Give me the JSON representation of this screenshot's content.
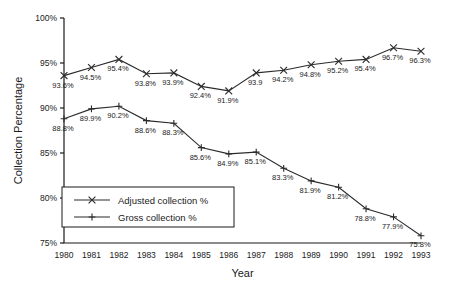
{
  "chart_data": {
    "type": "line",
    "title": "",
    "xlabel": "Year",
    "ylabel": "Collection Percentage",
    "grid": false,
    "legend_position": "inside-lower-left",
    "x": [
      1980,
      1981,
      1982,
      1983,
      1984,
      1985,
      1986,
      1987,
      1988,
      1989,
      1990,
      1991,
      1992,
      1993
    ],
    "categories": [
      "1980",
      "1981",
      "1982",
      "1983",
      "1984",
      "1985",
      "1986",
      "1987",
      "1988",
      "1989",
      "1990",
      "1991",
      "1992",
      "1993"
    ],
    "ylim": [
      75,
      100
    ],
    "yticks": [
      75,
      80,
      85,
      90,
      95,
      100
    ],
    "ytick_labels": [
      "75%",
      "80%",
      "85%",
      "90%",
      "95%",
      "100%"
    ],
    "series": [
      {
        "name": "Gross collection %",
        "marker": "x",
        "values": [
          93.6,
          94.5,
          95.4,
          93.8,
          93.9,
          92.4,
          91.9,
          93.9,
          94.2,
          94.8,
          95.2,
          95.4,
          96.7,
          96.3
        ],
        "data_labels": [
          "93.6%",
          "94.5%",
          "95.4%",
          "93.8%",
          "93.9%",
          "92.4%",
          "91.9%",
          "93.9",
          "94.2%",
          "94.8%",
          "95.2%",
          "95.4%",
          "96.7%",
          "96.3%"
        ]
      },
      {
        "name": "Adjusted collection %",
        "marker": "plus",
        "values": [
          88.8,
          89.9,
          90.2,
          88.6,
          88.3,
          85.6,
          84.9,
          85.1,
          83.3,
          81.9,
          81.2,
          78.8,
          77.9,
          75.8
        ],
        "data_labels": [
          "88.8%",
          "89.9%",
          "90.2%",
          "88.6%",
          "88.3%",
          "85.6%",
          "84.9%",
          "85.1%",
          "83.3%",
          "81.9%",
          "81.2%",
          "78.8%",
          "77.9%",
          "75.8%"
        ]
      }
    ],
    "legend": [
      {
        "label": "Adjusted collection %",
        "marker": "x"
      },
      {
        "label": "Gross collection %",
        "marker": "plus"
      }
    ],
    "colors": {
      "line": "#2b2b2b",
      "axis": "#1a1a1a",
      "background": "#ffffff",
      "text": "#1a1a1a"
    }
  }
}
